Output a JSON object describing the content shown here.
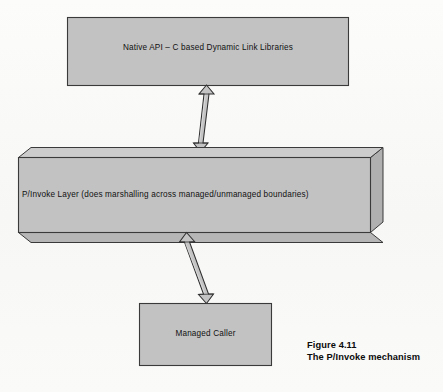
{
  "figure": {
    "background_color": "#fbfbfa",
    "box_fill_color": "#c2c2c2",
    "box_fill_shade_color": "#a9a9a9",
    "box_fill_light_color": "#cfcfcf",
    "box_stroke_color": "#3a3a3a",
    "arrow_fill_color": "#c4c4c4",
    "arrow_stroke_color": "#2f2f2f",
    "text_color": "#111111"
  },
  "boxes": {
    "native_api": {
      "label": "Native API – C based Dynamic Link Libraries",
      "shape": "rectangle"
    },
    "pinvoke_layer": {
      "label": "P/Invoke Layer (does marshalling across managed/unmanaged boundaries)",
      "shape": "3d-slab"
    },
    "managed_caller": {
      "label": "Managed Caller",
      "shape": "rectangle"
    }
  },
  "connectors": {
    "upper": {
      "name": "double-headed-arrow-native-api-to-pinvoke",
      "heads": "both"
    },
    "lower": {
      "name": "double-headed-arrow-managed-caller-to-pinvoke",
      "heads": "both"
    }
  },
  "caption": {
    "number": "Figure 4.11",
    "title": "The P/Invoke mechanism"
  }
}
